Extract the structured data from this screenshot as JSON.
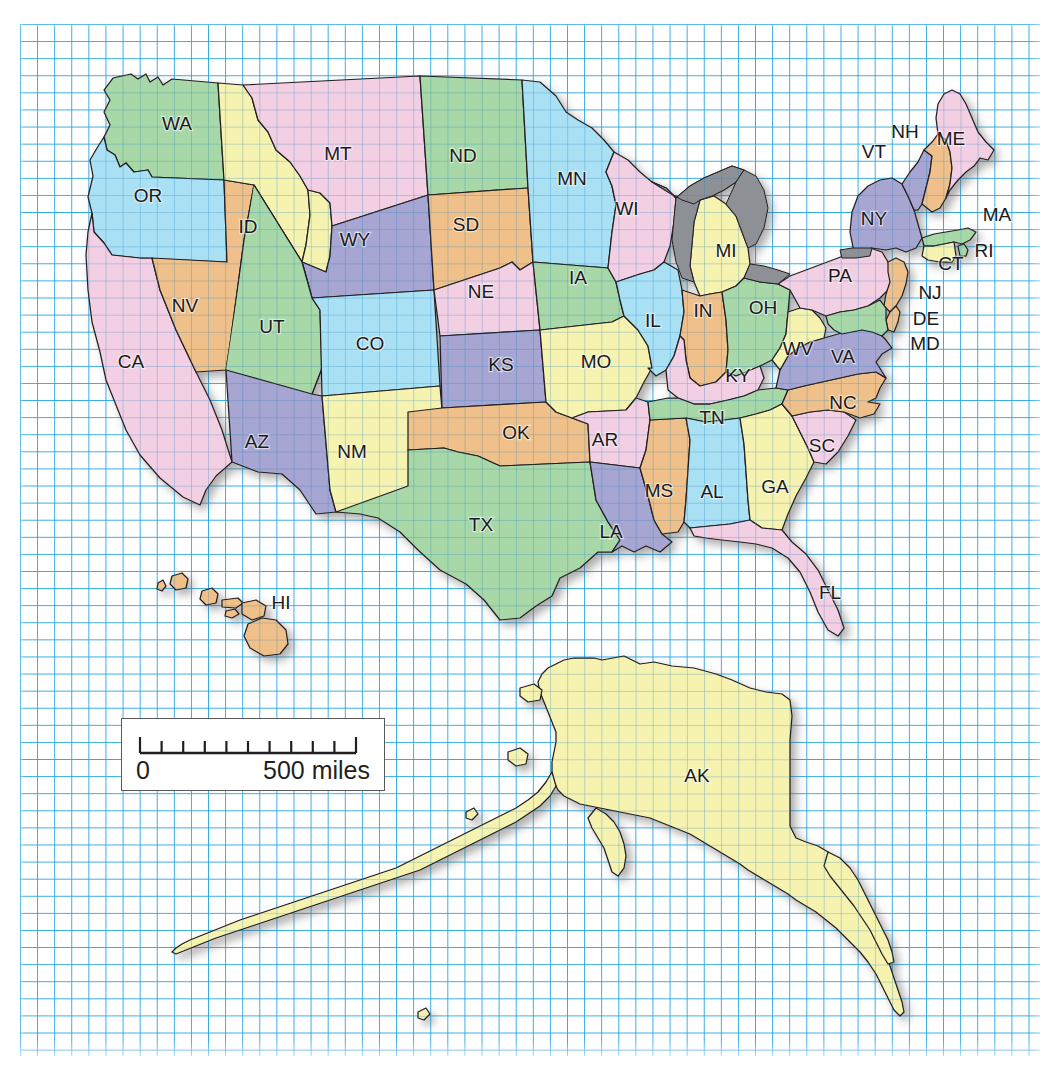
{
  "map": {
    "title": "United States state map with graph-paper grid overlay",
    "grid": {
      "color": "#29a6e2",
      "cell_px": 17,
      "visible": true
    },
    "scale_bar": {
      "zero_label": "0",
      "max_label": "500 miles",
      "divisions": 10
    },
    "colors": {
      "pink": "#f3cfe4",
      "green": "#a8d8a8",
      "yellow": "#f6f2b0",
      "blue": "#a9e0f4",
      "orange": "#f0c08a",
      "purple": "#a7a5d2",
      "lake": "#8d9195",
      "outline": "#231f20"
    },
    "states": [
      {
        "code": "WA",
        "label": "WA",
        "fill": "green",
        "x": 177,
        "y": 125
      },
      {
        "code": "OR",
        "label": "OR",
        "fill": "blue",
        "x": 148,
        "y": 197
      },
      {
        "code": "CA",
        "label": "CA",
        "fill": "pink",
        "x": 131,
        "y": 363
      },
      {
        "code": "NV",
        "label": "NV",
        "fill": "orange",
        "x": 185,
        "y": 307
      },
      {
        "code": "ID",
        "label": "ID",
        "fill": "yellow",
        "x": 248,
        "y": 228
      },
      {
        "code": "MT",
        "label": "MT",
        "fill": "pink",
        "x": 338,
        "y": 155
      },
      {
        "code": "WY",
        "label": "WY",
        "fill": "purple",
        "x": 355,
        "y": 241
      },
      {
        "code": "UT",
        "label": "UT",
        "fill": "green",
        "x": 272,
        "y": 328
      },
      {
        "code": "AZ",
        "label": "AZ",
        "fill": "purple",
        "x": 257,
        "y": 443
      },
      {
        "code": "CO",
        "label": "CO",
        "fill": "blue",
        "x": 370,
        "y": 345
      },
      {
        "code": "NM",
        "label": "NM",
        "fill": "yellow",
        "x": 352,
        "y": 453
      },
      {
        "code": "ND",
        "label": "ND",
        "fill": "green",
        "x": 463,
        "y": 157
      },
      {
        "code": "SD",
        "label": "SD",
        "fill": "orange",
        "x": 466,
        "y": 226
      },
      {
        "code": "NE",
        "label": "NE",
        "fill": "pink",
        "x": 481,
        "y": 293
      },
      {
        "code": "KS",
        "label": "KS",
        "fill": "purple",
        "x": 501,
        "y": 366
      },
      {
        "code": "OK",
        "label": "OK",
        "fill": "orange",
        "x": 516,
        "y": 434
      },
      {
        "code": "TX",
        "label": "TX",
        "fill": "green",
        "x": 481,
        "y": 526
      },
      {
        "code": "MN",
        "label": "MN",
        "fill": "blue",
        "x": 572,
        "y": 180
      },
      {
        "code": "IA",
        "label": "IA",
        "fill": "green",
        "x": 578,
        "y": 279
      },
      {
        "code": "MO",
        "label": "MO",
        "fill": "yellow",
        "x": 596,
        "y": 363
      },
      {
        "code": "AR",
        "label": "AR",
        "fill": "pink",
        "x": 605,
        "y": 441
      },
      {
        "code": "LA",
        "label": "LA",
        "fill": "purple",
        "x": 611,
        "y": 533
      },
      {
        "code": "WI",
        "label": "WI",
        "fill": "pink",
        "x": 627,
        "y": 210
      },
      {
        "code": "IL",
        "label": "IL",
        "fill": "blue",
        "x": 653,
        "y": 322
      },
      {
        "code": "MS",
        "label": "MS",
        "fill": "orange",
        "x": 659,
        "y": 492
      },
      {
        "code": "MI",
        "label": "MI",
        "fill": "yellow",
        "x": 726,
        "y": 252
      },
      {
        "code": "IN",
        "label": "IN",
        "fill": "orange",
        "x": 703,
        "y": 312
      },
      {
        "code": "KY",
        "label": "KY",
        "fill": "pink",
        "x": 738,
        "y": 377
      },
      {
        "code": "TN",
        "label": "TN",
        "fill": "green",
        "x": 712,
        "y": 419
      },
      {
        "code": "AL",
        "label": "AL",
        "fill": "blue",
        "x": 712,
        "y": 493
      },
      {
        "code": "OH",
        "label": "OH",
        "fill": "green",
        "x": 763,
        "y": 309
      },
      {
        "code": "GA",
        "label": "GA",
        "fill": "yellow",
        "x": 775,
        "y": 488
      },
      {
        "code": "FL",
        "label": "FL",
        "fill": "pink",
        "x": 830,
        "y": 594
      },
      {
        "code": "SC",
        "label": "SC",
        "fill": "pink",
        "x": 822,
        "y": 447
      },
      {
        "code": "NC",
        "label": "NC",
        "fill": "orange",
        "x": 843,
        "y": 404
      },
      {
        "code": "VA",
        "label": "VA",
        "fill": "purple",
        "x": 843,
        "y": 358
      },
      {
        "code": "WV",
        "label": "WV",
        "fill": "yellow",
        "x": 798,
        "y": 350
      },
      {
        "code": "PA",
        "label": "PA",
        "fill": "pink",
        "x": 840,
        "y": 277
      },
      {
        "code": "NY",
        "label": "NY",
        "fill": "purple",
        "x": 874,
        "y": 220
      },
      {
        "code": "ME",
        "label": "ME",
        "fill": "pink",
        "x": 951,
        "y": 140
      },
      {
        "code": "NH",
        "label": "NH",
        "fill": "orange",
        "x": 905,
        "y": 133
      },
      {
        "code": "VT",
        "label": "VT",
        "fill": "purple",
        "x": 874,
        "y": 153
      },
      {
        "code": "MA",
        "label": "MA",
        "fill": "green",
        "x": 997,
        "y": 216
      },
      {
        "code": "RI",
        "label": "RI",
        "fill": "green",
        "x": 984,
        "y": 252
      },
      {
        "code": "CT",
        "label": "CT",
        "fill": "yellow",
        "x": 951,
        "y": 265
      },
      {
        "code": "NJ",
        "label": "NJ",
        "fill": "orange",
        "x": 930,
        "y": 294
      },
      {
        "code": "DE",
        "label": "DE",
        "fill": "orange",
        "x": 926,
        "y": 320
      },
      {
        "code": "MD",
        "label": "MD",
        "fill": "green",
        "x": 925,
        "y": 345
      },
      {
        "code": "HI",
        "label": "HI",
        "fill": "orange",
        "x": 281,
        "y": 604
      },
      {
        "code": "AK",
        "label": "AK",
        "fill": "yellow",
        "x": 697,
        "y": 777
      }
    ]
  }
}
